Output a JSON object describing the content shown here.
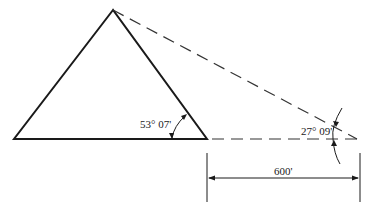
{
  "diagram": {
    "type": "geometry-triangulation",
    "angles": {
      "near": "53° 07'",
      "far": "27° 09'"
    },
    "distance": "600'",
    "colors": {
      "stroke": "#1a1a1a",
      "background": "#ffffff"
    }
  }
}
